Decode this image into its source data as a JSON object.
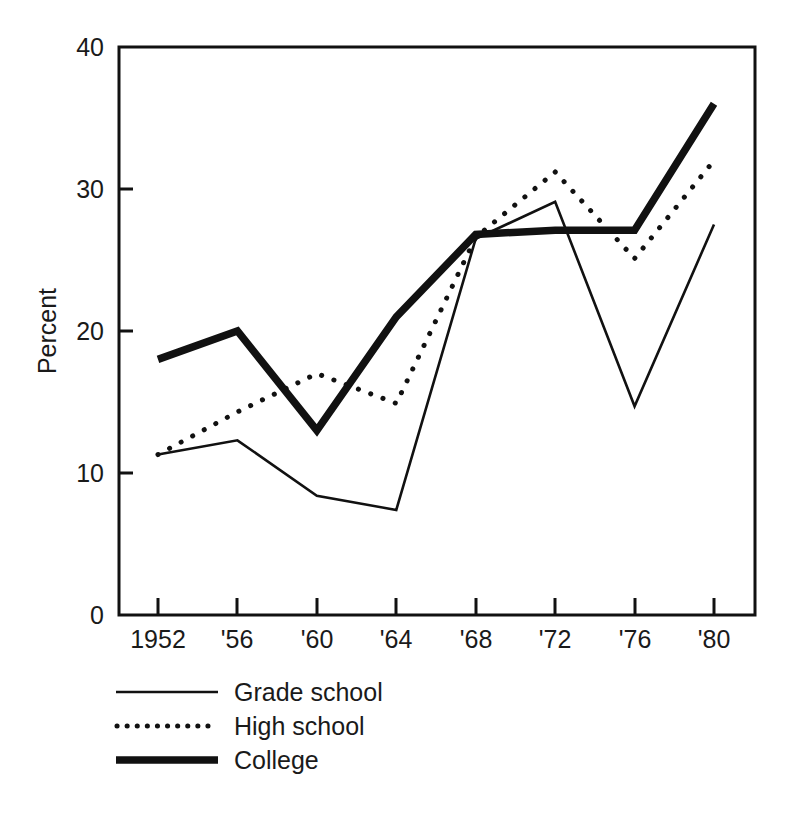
{
  "chart_data": {
    "type": "line",
    "title": "",
    "xlabel": "",
    "ylabel": "Percent",
    "x": [
      1952,
      1956,
      1960,
      1964,
      1968,
      1972,
      1976,
      1980
    ],
    "x_tick_labels": [
      "1952",
      "'56",
      "'60",
      "'64",
      "'68",
      "'72",
      "'76",
      "'80"
    ],
    "y_tick_labels": [
      "0",
      "10",
      "20",
      "30",
      "40"
    ],
    "y_ticks": [
      0,
      10,
      20,
      30,
      40
    ],
    "ylim": [
      0,
      40
    ],
    "xlim": [
      1950,
      1982
    ],
    "grid": false,
    "legend_position": "below-axes-left",
    "series": [
      {
        "name": "Grade school",
        "style": "thin-solid",
        "color": "#111111",
        "values": [
          11.3,
          12.3,
          8.4,
          7.4,
          26.5,
          29.1,
          14.7,
          27.5
        ]
      },
      {
        "name": "High school",
        "style": "dotted",
        "color": "#111111",
        "values": [
          11.3,
          14.3,
          17.0,
          14.9,
          26.6,
          31.2,
          25.1,
          32.0
        ]
      },
      {
        "name": "College",
        "style": "thick-solid",
        "color": "#111111",
        "values": [
          18.0,
          20.0,
          13.0,
          21.0,
          26.8,
          27.1,
          27.1,
          36.0
        ]
      }
    ]
  },
  "legend": {
    "items": [
      {
        "label": "Grade school",
        "style": "thin-solid"
      },
      {
        "label": "High school",
        "style": "dotted"
      },
      {
        "label": "College",
        "style": "thick-solid"
      }
    ]
  },
  "axes": {
    "y_axis_title": "Percent"
  }
}
